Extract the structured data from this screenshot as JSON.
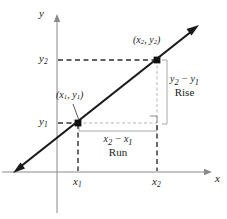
{
  "figure": {
    "kind": "coordinate-plane-slope-diagram",
    "width": 227,
    "height": 219,
    "background": "#ffffff",
    "ink": "#1a1a1a",
    "axis_color": "#8a8a8a",
    "guide_color": "#a8a8a8",
    "dash_color": "#3a3a3a"
  },
  "axes": {
    "y_axis_label": "y",
    "x_axis_label": "x",
    "origin_px": {
      "x": 57,
      "y": 172
    },
    "y_axis_top_px": 16,
    "y_axis_bottom_px": 213,
    "x_axis_right_px": 212,
    "x_axis_left_px": 2
  },
  "ticks": {
    "x": [
      {
        "label_main": "x",
        "label_sub": "1",
        "px": 78
      },
      {
        "label_main": "x",
        "label_sub": "2",
        "px": 157
      }
    ],
    "y": [
      {
        "label_main": "y",
        "label_sub": "2",
        "px": 60
      },
      {
        "label_main": "y",
        "label_sub": "1",
        "px": 123
      }
    ]
  },
  "points": [
    {
      "name": "point-1",
      "label_parts": {
        "open": "(",
        "x_main": "x",
        "x_sub": "1",
        "comma": ", ",
        "y_main": "y",
        "y_sub": "1",
        "close": ")"
      },
      "px": {
        "x": 78,
        "y": 123
      },
      "label_px": {
        "x": 57,
        "y": 96
      }
    },
    {
      "name": "point-2",
      "label_parts": {
        "open": "(",
        "x_main": "x",
        "x_sub": "2",
        "comma": ", ",
        "y_main": "y",
        "y_sub": "2",
        "close": ")"
      },
      "px": {
        "x": 157,
        "y": 60
      },
      "label_px": {
        "x": 133,
        "y": 41
      }
    }
  ],
  "line": {
    "name": "slope-line",
    "from_px": {
      "x": 14,
      "y": 172
    },
    "to_px": {
      "x": 198,
      "y": 26
    },
    "arrow_both_ends": true
  },
  "annotations": {
    "rise": {
      "expression": "y₂ − y₁",
      "expr_main_1": "y",
      "expr_sub_1": "2",
      "expr_op": " − ",
      "expr_main_2": "y",
      "expr_sub_2": "1",
      "word": "Rise",
      "label_px": {
        "x": 171,
        "y": 82
      },
      "bracket_px": {
        "x": 167,
        "y1": 60,
        "y2": 124
      }
    },
    "run": {
      "expression": "x₂ − x₁",
      "expr_main_1": "x",
      "expr_sub_1": "2",
      "expr_op": " − ",
      "expr_main_2": "x",
      "expr_sub_2": "1",
      "word": "Run",
      "label_px": {
        "x": 117,
        "y": 134
      },
      "bracket_px": {
        "y": 131,
        "x1": 79,
        "x2": 157
      }
    },
    "right_angle_marker_px": {
      "x": 150,
      "y": 116,
      "size": 7
    }
  }
}
